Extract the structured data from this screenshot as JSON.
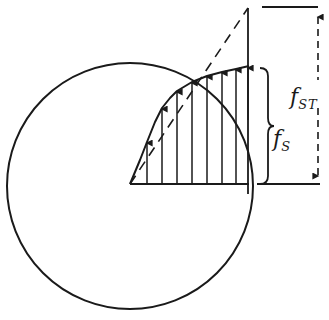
{
  "diagram": {
    "title": "",
    "stroke_color": "#1a1a1a",
    "background": "#ffffff",
    "circle": {
      "cx": 130,
      "cy": 186,
      "r": 123
    },
    "baseline": {
      "x1": 130,
      "x2": 249,
      "y": 184
    },
    "apex": {
      "x": 248,
      "y": 8
    },
    "stress_curve_points": [
      [
        130,
        184
      ],
      [
        140,
        160
      ],
      [
        147,
        142
      ],
      [
        155,
        122
      ],
      [
        162,
        108
      ],
      [
        170,
        98
      ],
      [
        177,
        91
      ],
      [
        192,
        82
      ],
      [
        207,
        76
      ],
      [
        222,
        72
      ],
      [
        236,
        69
      ],
      [
        249,
        66
      ]
    ],
    "arrows_x": [
      147,
      162,
      177,
      192,
      207,
      222,
      236
    ],
    "labels": {
      "f_s": {
        "main": "f",
        "sub": "S"
      },
      "f_st": {
        "main": "f",
        "sub": "ST"
      }
    },
    "dimension": {
      "top_line": {
        "x1": 262,
        "x2": 318,
        "y": 7
      },
      "bottom_line": {
        "x1": 257,
        "x2": 320,
        "y": 184
      },
      "arrow_x": 318
    },
    "brace": {
      "x": 260,
      "y_top": 68,
      "y_bottom": 184
    }
  }
}
